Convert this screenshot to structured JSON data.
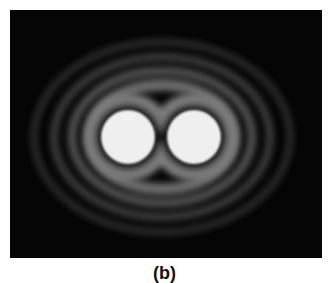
{
  "figure": {
    "caption": "(b)",
    "colors": {
      "background": "#050505",
      "spot": "#efefef",
      "ring": "#8a8a8a",
      "page": "#ffffff"
    }
  }
}
